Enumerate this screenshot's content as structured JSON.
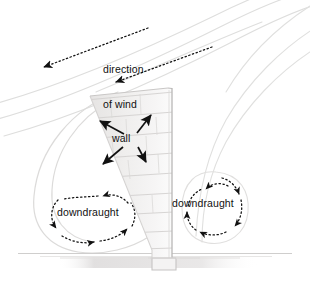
{
  "diagram": {
    "title_text_present": false,
    "background_color": "#ffffff",
    "ink_color": "#111111",
    "faint_line_color": "#d8d8d8",
    "brick_fill_color": "#eceaea",
    "brick_line_color": "#cfcccc",
    "ground_shadow_color": "#e2e0e0",
    "labels": {
      "direction_of_wind_line1": "direction",
      "direction_of_wind_line2": "of wind",
      "wall": "wall",
      "downdraught_left": "downdraught",
      "downdraught_right": "downdraught"
    },
    "annotations": {
      "wind_arrows": [
        {
          "name": "wind-arrow-upper",
          "style": "dotted",
          "direction": "down-left",
          "from_x": 148,
          "from_y": 28,
          "to_x": 38,
          "to_y": 69
        },
        {
          "name": "wind-arrow-lower",
          "style": "dotted",
          "direction": "down-left",
          "from_x": 212,
          "from_y": 47,
          "to_x": 110,
          "to_y": 84
        }
      ],
      "wall_arrows": [
        {
          "name": "wall-arrow-up-left",
          "style": "solid",
          "direction": "up-left",
          "from_x": 123,
          "from_y": 133,
          "to_x": 97,
          "to_y": 120
        },
        {
          "name": "wall-arrow-up-right",
          "style": "solid",
          "direction": "up-right",
          "from_x": 138,
          "from_y": 133,
          "to_x": 152,
          "to_y": 113
        },
        {
          "name": "wall-arrow-down-left",
          "style": "solid",
          "direction": "down-left",
          "from_x": 122,
          "from_y": 147,
          "to_x": 100,
          "to_y": 166
        },
        {
          "name": "wall-arrow-down-right",
          "style": "solid",
          "direction": "down-right",
          "from_x": 139,
          "from_y": 147,
          "to_x": 145,
          "to_y": 164
        }
      ],
      "vortices": [
        {
          "name": "downdraught-vortex-left",
          "center_x": 93,
          "center_y": 215,
          "radius_x": 42,
          "radius_y": 30,
          "rotation": "clockwise",
          "style": "dotted"
        },
        {
          "name": "downdraught-vortex-right",
          "center_x": 214,
          "center_y": 209,
          "radius_x": 32,
          "radius_y": 31,
          "rotation": "clockwise",
          "style": "dotted"
        }
      ],
      "wall_geometry": {
        "top_y": 88,
        "base_y": 267,
        "right_edge_x": 172,
        "left_edge_top_x": 90,
        "left_edge_bottom_x": 152,
        "brick_course_count": 9
      },
      "ground_line_y": 253
    }
  }
}
